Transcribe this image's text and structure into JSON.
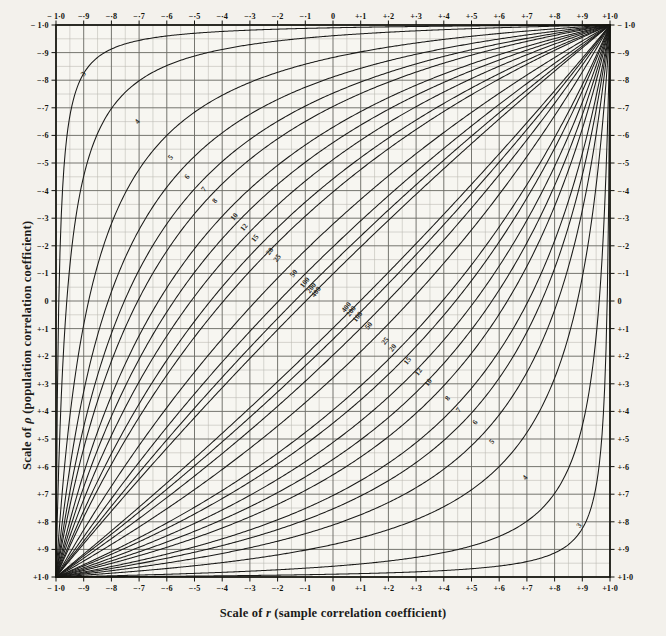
{
  "figure": {
    "kind": "nomogram",
    "paper_color": "#f3f1ec",
    "ink_color": "#1a1a18",
    "grid_major_color": "#6f6f68",
    "grid_minor_color": "#b9b8b0",
    "frame_color": "#14140f"
  },
  "axes": {
    "x_title_prefix": "Scale of ",
    "x_title_symbol": "r",
    "x_title_suffix": " (sample correlation coefficient)",
    "y_title_prefix": "Scale of ",
    "y_title_symbol": "ρ",
    "y_title_suffix": " (population correlation coefficient)",
    "x_min": -1.0,
    "x_max": 1.0,
    "y_min": -1.0,
    "y_max": 1.0,
    "major_step": 0.1,
    "minor_step": 0.05,
    "grid": true,
    "bottom_tick_labels": [
      "− 1·0",
      "−·9",
      "−·8",
      "−·7",
      "−·6",
      "−·5",
      "−·4",
      "−·3",
      "−·2",
      "−·1",
      "0",
      "+·1",
      "+·2",
      "+·3",
      "+·4",
      "+·5",
      "+·6",
      "+·7",
      "+·8",
      "+·9",
      "+1·0"
    ],
    "top_tick_labels": [
      "− 1·0",
      "−·9",
      "−·8",
      "−·7",
      "−·6",
      "−·5",
      "−·4",
      "−·3",
      "−·2",
      "−·1",
      "0",
      "+·1",
      "+·2",
      "+·3",
      "+·4",
      "+·5",
      "+·6",
      "+·7",
      "+·8",
      "+·9",
      "+1·0"
    ],
    "left_tick_labels": [
      "+1·0",
      "+·9",
      "+·8",
      "+·7",
      "+·6",
      "+·5",
      "+·4",
      "+·3",
      "+·2",
      "+·1",
      "0",
      "−·1",
      "−·2",
      "−·3",
      "−·4",
      "−·5",
      "−·6",
      "−·7",
      "−·8",
      "−·9",
      "− 1·0"
    ],
    "right_tick_labels": [
      "+1·0",
      "+·9",
      "+·8",
      "+·7",
      "+·6",
      "+·5",
      "+·4",
      "+·3",
      "+·2",
      "+·1",
      "0",
      "−·1",
      "−·2",
      "−·3",
      "−·4",
      "−·5",
      "−·6",
      "−·7",
      "−·8",
      "−·9",
      "− 1·0"
    ],
    "tick_values": [
      -1.0,
      -0.9,
      -0.8,
      -0.7,
      -0.6,
      -0.5,
      -0.4,
      -0.3,
      -0.2,
      -0.1,
      0,
      0.1,
      0.2,
      0.3,
      0.4,
      0.5,
      0.6,
      0.7,
      0.8,
      0.9,
      1.0
    ]
  },
  "chart_data": {
    "type": "line",
    "title": "",
    "subtitle": "",
    "xlabel": "Scale of r (sample correlation coefficient)",
    "ylabel": "Scale of ρ (population correlation coefficient)",
    "xlim": [
      -1.0,
      1.0
    ],
    "ylim": [
      -1.0,
      1.0
    ],
    "grid": true,
    "legend": "inline curve labels",
    "confidence_level": 0.95,
    "curve_parameter_name": "n (sample size)",
    "sample_sizes": [
      3,
      4,
      5,
      6,
      7,
      8,
      10,
      12,
      15,
      20,
      25,
      50,
      100,
      200,
      400
    ],
    "curve_labels": [
      "3",
      "4",
      "5",
      "6",
      "7",
      "8",
      "10",
      "12",
      "15",
      "20",
      "25",
      "50",
      "100",
      "200",
      "400"
    ],
    "label_positions_upper": [
      {
        "n": 3,
        "r": -0.895,
        "rho": 0.818
      },
      {
        "n": 4,
        "r": -0.7,
        "rho": 0.645
      },
      {
        "n": 5,
        "r": -0.58,
        "rho": 0.515
      },
      {
        "n": 6,
        "r": -0.52,
        "rho": 0.445
      },
      {
        "n": 7,
        "r": -0.46,
        "rho": 0.4
      },
      {
        "n": 8,
        "r": -0.42,
        "rho": 0.358
      },
      {
        "n": 10,
        "r": -0.35,
        "rho": 0.3
      },
      {
        "n": 12,
        "r": -0.315,
        "rho": 0.262
      },
      {
        "n": 15,
        "r": -0.275,
        "rho": 0.222
      },
      {
        "n": 20,
        "r": -0.222,
        "rho": 0.175
      },
      {
        "n": 25,
        "r": -0.195,
        "rho": 0.15
      },
      {
        "n": 50,
        "r": -0.135,
        "rho": 0.095
      },
      {
        "n": 100,
        "r": -0.095,
        "rho": 0.062
      },
      {
        "n": 200,
        "r": -0.072,
        "rho": 0.042
      },
      {
        "n": 400,
        "r": -0.055,
        "rho": 0.028
      }
    ],
    "label_positions_lower": [
      {
        "n": 3,
        "r": 0.895,
        "rho": -0.818
      },
      {
        "n": 4,
        "r": 0.7,
        "rho": -0.645
      },
      {
        "n": 5,
        "r": 0.58,
        "rho": -0.515
      },
      {
        "n": 6,
        "r": 0.52,
        "rho": -0.445
      },
      {
        "n": 7,
        "r": 0.46,
        "rho": -0.4
      },
      {
        "n": 8,
        "r": 0.42,
        "rho": -0.358
      },
      {
        "n": 10,
        "r": 0.35,
        "rho": -0.3
      },
      {
        "n": 12,
        "r": 0.315,
        "rho": -0.262
      },
      {
        "n": 15,
        "r": 0.275,
        "rho": -0.222
      },
      {
        "n": 20,
        "r": 0.222,
        "rho": -0.175
      },
      {
        "n": 25,
        "r": 0.195,
        "rho": -0.15
      },
      {
        "n": 50,
        "r": 0.135,
        "rho": -0.095
      },
      {
        "n": 100,
        "r": 0.095,
        "rho": -0.062
      },
      {
        "n": 200,
        "r": 0.072,
        "rho": -0.042
      },
      {
        "n": 400,
        "r": 0.055,
        "rho": -0.028
      }
    ]
  },
  "plot_box": {
    "left": 56,
    "top": 25,
    "right": 610,
    "bottom": 577
  }
}
